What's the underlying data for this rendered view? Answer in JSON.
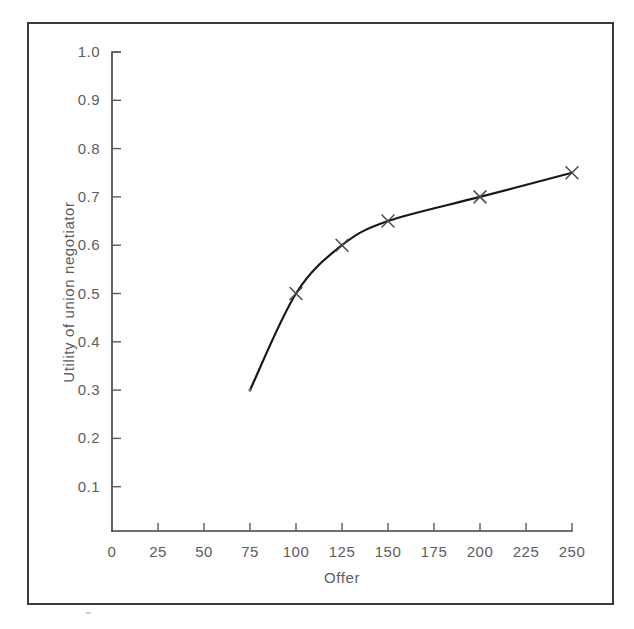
{
  "figure": {
    "caption": "",
    "background_color": "#ffffff",
    "frame_color": "#3a3a3a",
    "ink_color": "#17171c",
    "label_color": "#5d5d5d"
  },
  "chart_data": {
    "type": "line",
    "title": "",
    "subtitle": "",
    "xlabel": "Offer",
    "ylabel": "Utility of union negotiator",
    "xlim": [
      0,
      250
    ],
    "ylim": [
      0,
      1.0
    ],
    "xticks": [
      0,
      25,
      50,
      75,
      100,
      125,
      150,
      175,
      200,
      225,
      250
    ],
    "xticklabels": [
      "0",
      "25",
      "50",
      "75",
      "100",
      "125",
      "150",
      "175",
      "200",
      "225",
      "250"
    ],
    "yticks": [
      0.1,
      0.2,
      0.3,
      0.4,
      0.5,
      0.6,
      0.7,
      0.8,
      0.9,
      1.0
    ],
    "yticklabels": [
      "0.1",
      "0.2",
      "0.3",
      "0.4",
      "0.5",
      "0.6",
      "0.7",
      "0.8",
      "0.9",
      "1.0"
    ],
    "grid": false,
    "legend": false,
    "legend_position": "none",
    "marker": "x",
    "series": [
      {
        "name": "Utility of union negotiator",
        "x": [
          75,
          100,
          125,
          150,
          200,
          250
        ],
        "values": [
          0.3,
          0.5,
          0.6,
          0.65,
          0.7,
          0.75
        ],
        "color": "#17171c"
      }
    ],
    "annotations": []
  },
  "axis": {
    "x_title": "Offer",
    "y_title": "Utility of union negotiator"
  }
}
